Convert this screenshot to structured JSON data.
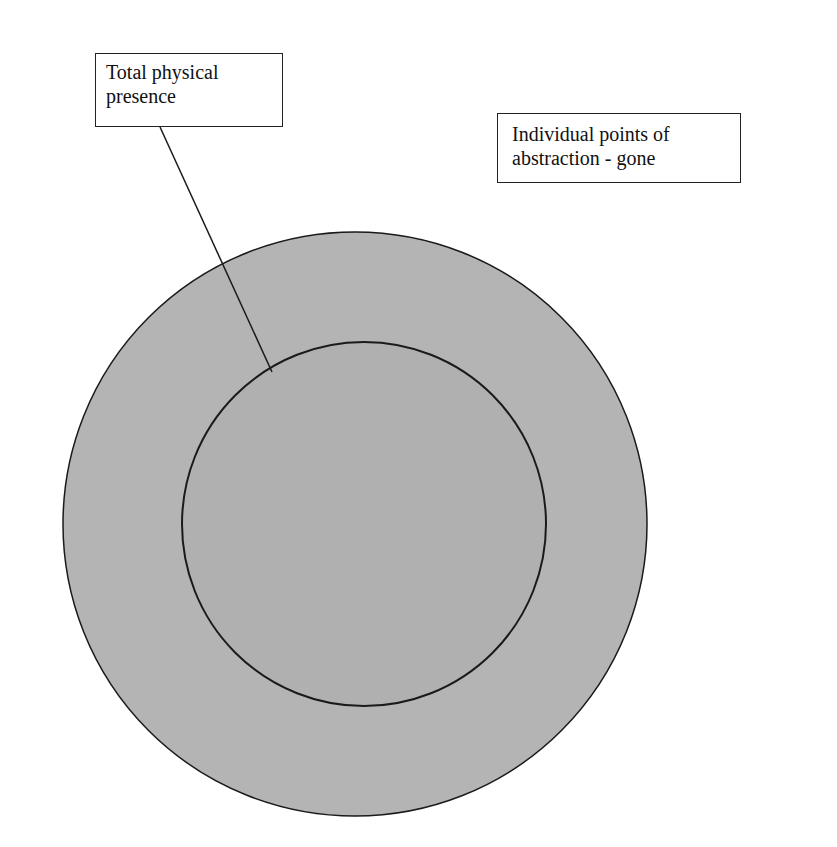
{
  "labels": {
    "box1": {
      "line1": "Total physical",
      "line2": "presence"
    },
    "box2": {
      "line1": "Individual points of",
      "line2": "abstraction - gone"
    }
  },
  "colors": {
    "circle_fill": "#b4b4b4",
    "inner_fill": "#b0b0b0",
    "stroke": "#1a1a1a"
  },
  "shapes": {
    "outer_circle": {
      "cx": 355,
      "cy": 524,
      "r": 292
    },
    "inner_circle": {
      "cx": 364,
      "cy": 524,
      "r": 182
    },
    "connector": {
      "x1": 160,
      "y1": 127,
      "x2": 272,
      "y2": 372
    }
  }
}
